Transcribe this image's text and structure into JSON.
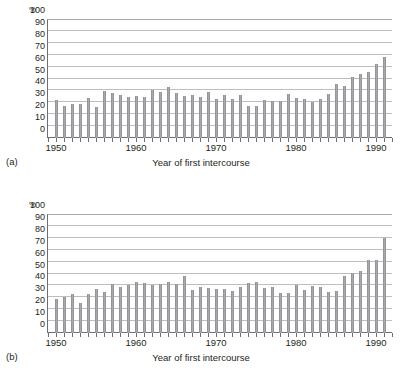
{
  "figure": {
    "panels": [
      {
        "id": "a",
        "panel_label": "(a)",
        "unit_label": "%",
        "xlabel": "Year of first intercourse"
      },
      {
        "id": "b",
        "panel_label": "(b)",
        "unit_label": "%",
        "xlabel": "Year of first intercourse"
      }
    ]
  },
  "chart_data": [
    {
      "type": "bar",
      "title": "",
      "panel": "(a)",
      "xlabel": "Year of first intercourse",
      "ylabel": "%",
      "ylim": [
        0,
        100
      ],
      "yticks": [
        0,
        10,
        20,
        30,
        40,
        50,
        60,
        70,
        80,
        90,
        100
      ],
      "ytick_labels": [
        "0",
        "10",
        "20",
        "30",
        "40",
        "50",
        "60",
        "70",
        "80",
        "90",
        "100"
      ],
      "xtick_labels": [
        "1950",
        "1960",
        "1970",
        "1980",
        "1990"
      ],
      "xtick_values": [
        1950,
        1960,
        1970,
        1980,
        1990
      ],
      "xlim": [
        1949,
        1992
      ],
      "grid": true,
      "legend": "none",
      "bar_color": "#a7a9ac",
      "categories": [
        1950,
        1951,
        1952,
        1953,
        1954,
        1955,
        1956,
        1957,
        1958,
        1959,
        1960,
        1961,
        1962,
        1963,
        1964,
        1965,
        1966,
        1967,
        1968,
        1969,
        1970,
        1971,
        1972,
        1973,
        1974,
        1975,
        1976,
        1977,
        1978,
        1979,
        1980,
        1981,
        1982,
        1983,
        1984,
        1985,
        1986,
        1987,
        1988,
        1989,
        1990,
        1991
      ],
      "values": [
        32,
        27,
        28.5,
        28.5,
        34,
        26,
        39.5,
        38,
        36,
        34.5,
        35,
        34.5,
        40,
        39,
        43,
        38,
        35.5,
        36,
        34.5,
        38.5,
        32.5,
        36.5,
        32.5,
        36.5,
        27,
        27,
        32,
        31.5,
        31,
        37,
        34,
        32.5,
        30.5,
        33,
        37,
        45.5,
        43.5,
        51,
        53.5,
        55.5,
        62.5,
        68.5
      ]
    },
    {
      "type": "bar",
      "title": "",
      "panel": "(b)",
      "xlabel": "Year of first intercourse",
      "ylabel": "%",
      "ylim": [
        0,
        100
      ],
      "yticks": [
        0,
        10,
        20,
        30,
        40,
        50,
        60,
        70,
        80,
        90,
        100
      ],
      "ytick_labels": [
        "0",
        "10",
        "20",
        "30",
        "40",
        "50",
        "60",
        "70",
        "80",
        "90",
        "100"
      ],
      "xtick_labels": [
        "1950",
        "1960",
        "1970",
        "1980",
        "1990"
      ],
      "xtick_values": [
        1950,
        1960,
        1970,
        1980,
        1990
      ],
      "xlim": [
        1949,
        1992
      ],
      "grid": true,
      "legend": "none",
      "bar_color": "#a7a9ac",
      "categories": [
        1950,
        1951,
        1952,
        1953,
        1954,
        1955,
        1956,
        1957,
        1958,
        1959,
        1960,
        1961,
        1962,
        1963,
        1964,
        1965,
        1966,
        1967,
        1968,
        1969,
        1970,
        1971,
        1972,
        1973,
        1974,
        1975,
        1976,
        1977,
        1978,
        1979,
        1980,
        1981,
        1982,
        1983,
        1984,
        1985,
        1986,
        1987,
        1988,
        1989,
        1990,
        1991
      ],
      "values": [
        29,
        30,
        32.5,
        25,
        32.5,
        37,
        34.5,
        41.5,
        38.5,
        40,
        43,
        42,
        40,
        41.5,
        42.5,
        41.5,
        47.5,
        36.5,
        39,
        37.5,
        37,
        37,
        35.5,
        39,
        42,
        42.5,
        37.5,
        39,
        33.5,
        33.5,
        40,
        36.5,
        39.5,
        38.5,
        34.5,
        35.5,
        47.5,
        50.5,
        52.5,
        61.5,
        61.5,
        80
      ]
    }
  ]
}
